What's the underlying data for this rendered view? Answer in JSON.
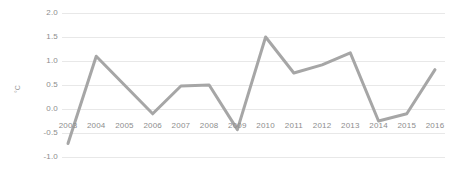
{
  "chart_data": {
    "type": "line",
    "title": "",
    "xlabel": "",
    "ylabel": "°C",
    "categories": [
      "2003",
      "2004",
      "2005",
      "2006",
      "2007",
      "2008",
      "2009",
      "2010",
      "2011",
      "2012",
      "2013",
      "2014",
      "2015",
      "2016"
    ],
    "values": [
      -0.72,
      1.1,
      0.5,
      -0.1,
      0.48,
      0.5,
      -0.43,
      1.5,
      0.75,
      0.92,
      1.17,
      -0.25,
      -0.1,
      0.82
    ],
    "series": [
      {
        "name": "",
        "values": [
          -0.72,
          1.1,
          0.5,
          -0.1,
          0.48,
          0.5,
          -0.43,
          1.5,
          0.75,
          0.92,
          1.17,
          -0.25,
          -0.1,
          0.82
        ]
      }
    ],
    "ylim": [
      -1.0,
      2.0
    ],
    "y_ticks": [
      "2.0",
      "1.5",
      "1.0",
      "0.5",
      "0.0",
      "-0.5",
      "-1.0"
    ],
    "y_tick_values": [
      2.0,
      1.5,
      1.0,
      0.5,
      0.0,
      -0.5,
      -1.0
    ],
    "grid": true,
    "legend": "none",
    "line_color": "#a6a6a6",
    "grid_color": "#e8e8e8",
    "text_color": "#8d8d8d",
    "background_color": "#ffffff"
  }
}
